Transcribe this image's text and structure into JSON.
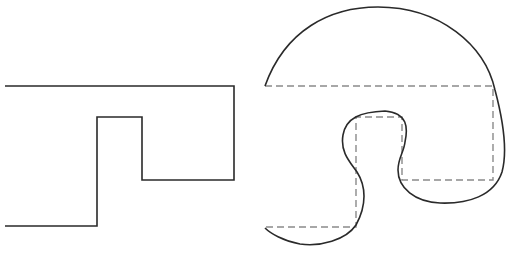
{
  "diagram": {
    "stroke_color": "#2a2a2a",
    "dash_color": "#8a8a8a",
    "left_shape": {
      "type": "rectilinear-polyline",
      "points": [
        [
          5,
          86
        ],
        [
          234,
          86
        ],
        [
          234,
          180
        ],
        [
          142,
          180
        ],
        [
          142,
          117
        ],
        [
          97,
          117
        ],
        [
          97,
          226
        ],
        [
          5,
          226
        ]
      ]
    },
    "right_shape": {
      "type": "curved-outline-with-dashed-guide",
      "guide_points": [
        [
          265,
          86
        ],
        [
          493,
          86
        ],
        [
          493,
          180
        ],
        [
          402,
          180
        ],
        [
          402,
          117
        ],
        [
          356,
          117
        ],
        [
          356,
          227
        ],
        [
          265,
          227
        ]
      ],
      "curve_path": "M265,86 C285,30 330,7 378,7 C440,7 485,45 495,90 C503,120 508,150 502,172 C494,196 468,204 440,203 C415,202 398,188 398,170 C398,158 404,152 405,142 C408,128 408,113 385,111 C360,112 346,118 343,135 C340,152 350,162 357,172 C366,186 367,205 356,225 C346,240 320,247 300,244 C283,241 270,233 265,228"
    }
  }
}
